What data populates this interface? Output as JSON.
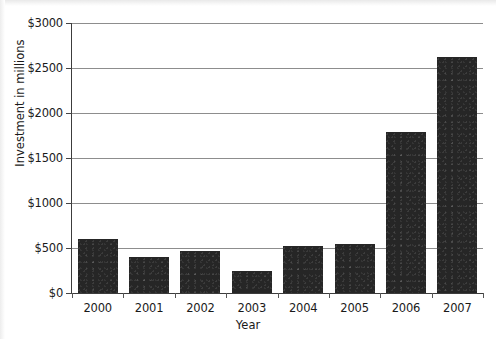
{
  "chart_data": {
    "type": "bar",
    "title": "",
    "xlabel": "Year",
    "ylabel": "Investment in millions",
    "categories": [
      "2000",
      "2001",
      "2002",
      "2003",
      "2004",
      "2005",
      "2006",
      "2007"
    ],
    "values": [
      600,
      400,
      470,
      250,
      520,
      550,
      1790,
      2620
    ],
    "ylim": [
      0,
      3000
    ],
    "ytick_labels": [
      "$0",
      "$500",
      "$1000",
      "$1500",
      "$2000",
      "$2500",
      "$3000"
    ],
    "ytick_values": [
      0,
      500,
      1000,
      1500,
      2000,
      2500,
      3000
    ],
    "grid": "horizontal",
    "legend": "none",
    "bar_color": "#262626",
    "axis_color": "#3c3c3c",
    "gridline_color": "#8d8d8d",
    "background_color": "#ffffff"
  }
}
